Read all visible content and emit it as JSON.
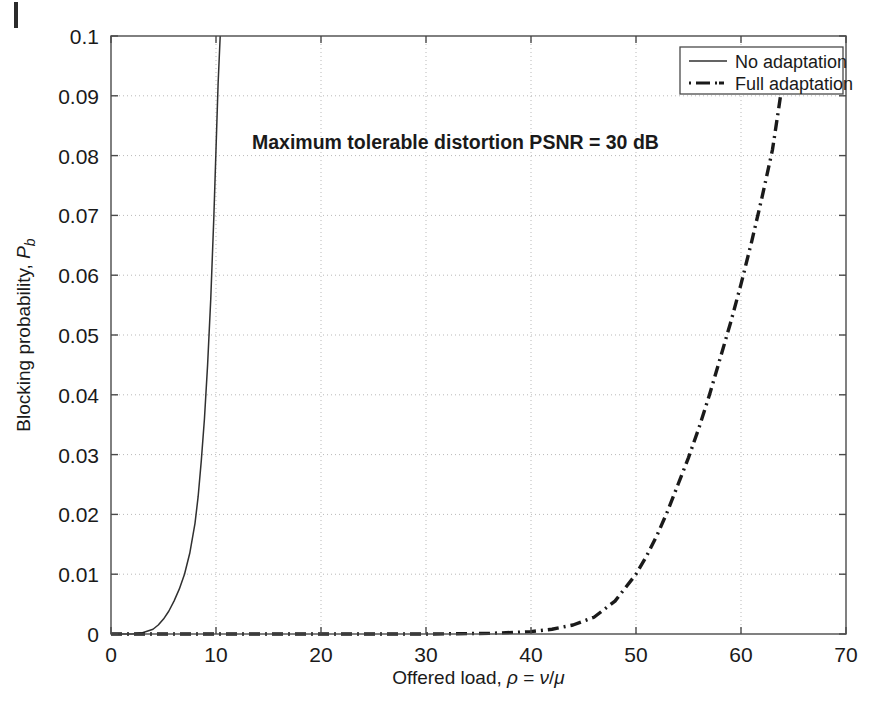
{
  "chart_data": {
    "type": "line",
    "title": "",
    "annotation": "Maximum tolerable distortion PSNR = 30 dB",
    "xlabel_parts": {
      "prefix": "Offered load, ",
      "rho": "ρ",
      "equals": " = ",
      "nu": "ν",
      "slash": "/",
      "mu": "μ"
    },
    "xlabel": "Offered load, ρ = ν/μ",
    "ylabel_parts": {
      "prefix": "Blocking probability, ",
      "symbol": "P",
      "subscript": "b"
    },
    "ylabel": "Blocking probability, P_b",
    "xlim": [
      0,
      70
    ],
    "ylim": [
      0,
      0.1
    ],
    "xticks": [
      0,
      10,
      20,
      30,
      40,
      50,
      60,
      70
    ],
    "xtick_labels": [
      "0",
      "10",
      "20",
      "30",
      "40",
      "50",
      "60",
      "70"
    ],
    "yticks": [
      0,
      0.01,
      0.02,
      0.03,
      0.04,
      0.05,
      0.06,
      0.07,
      0.08,
      0.09,
      0.1
    ],
    "ytick_labels": [
      "0",
      "0.01",
      "0.02",
      "0.03",
      "0.04",
      "0.05",
      "0.06",
      "0.07",
      "0.08",
      "0.09",
      "0.1"
    ],
    "grid": true,
    "grid_style": "dotted",
    "grid_color": "#b9b9b9",
    "axis_color": "#4a4a4a",
    "legend_position": "top-right",
    "series": [
      {
        "name": "No adaptation",
        "style": "solid",
        "color": "#303030",
        "points": [
          [
            0,
            0.0
          ],
          [
            1,
            0.0
          ],
          [
            2,
            0.0
          ],
          [
            3,
            0.0002
          ],
          [
            4,
            0.0008
          ],
          [
            4.5,
            0.0015
          ],
          [
            5,
            0.0025
          ],
          [
            5.5,
            0.0038
          ],
          [
            6,
            0.0055
          ],
          [
            6.5,
            0.0075
          ],
          [
            7,
            0.01
          ],
          [
            7.5,
            0.0135
          ],
          [
            8,
            0.0185
          ],
          [
            8.3,
            0.023
          ],
          [
            8.6,
            0.029
          ],
          [
            8.9,
            0.036
          ],
          [
            9.2,
            0.045
          ],
          [
            9.5,
            0.056
          ],
          [
            9.8,
            0.07
          ],
          [
            10.0,
            0.081
          ],
          [
            10.2,
            0.092
          ],
          [
            10.4,
            0.1
          ]
        ]
      },
      {
        "name": "Full adaptation",
        "style": "dashdot",
        "color": "#1a1a1a",
        "points": [
          [
            0,
            0.0
          ],
          [
            10,
            0.0
          ],
          [
            20,
            0.0
          ],
          [
            30,
            0.0
          ],
          [
            36,
            0.0001
          ],
          [
            40,
            0.0004
          ],
          [
            42,
            0.0008
          ],
          [
            44,
            0.0015
          ],
          [
            46,
            0.0028
          ],
          [
            48,
            0.0055
          ],
          [
            50,
            0.01
          ],
          [
            51,
            0.013
          ],
          [
            52,
            0.0165
          ],
          [
            53,
            0.0205
          ],
          [
            54,
            0.025
          ],
          [
            55,
            0.0295
          ],
          [
            56,
            0.0345
          ],
          [
            57,
            0.04
          ],
          [
            58,
            0.046
          ],
          [
            59,
            0.052
          ],
          [
            60,
            0.0585
          ],
          [
            61,
            0.0655
          ],
          [
            62,
            0.073
          ],
          [
            63,
            0.081
          ],
          [
            63.6,
            0.088
          ],
          [
            64.1,
            0.094
          ]
        ]
      }
    ]
  },
  "legend": {
    "items": [
      {
        "label": "No adaptation",
        "style": "solid"
      },
      {
        "label": "Full adaptation",
        "style": "dashdot"
      }
    ]
  }
}
